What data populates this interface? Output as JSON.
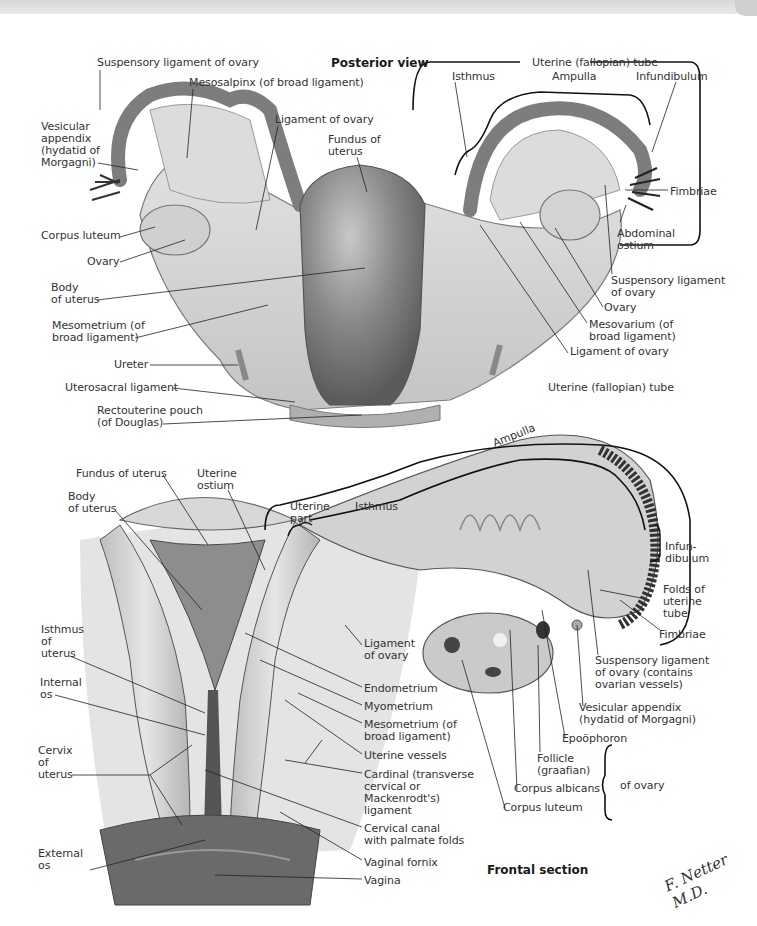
{
  "figure": {
    "colors": {
      "background": "#ffffff",
      "tissue_light": "#d9d9d9",
      "tissue_mid": "#a8a8a8",
      "tissue_dark": "#6e6e6e",
      "line": "#222222"
    },
    "posterior": {
      "title": "Posterior view",
      "labels": [
        {
          "id": "susp-lig-ovary-l",
          "text": "Suspensory ligament of ovary",
          "x": 97,
          "y": 57
        },
        {
          "id": "mesosalpinx",
          "text": "Mesosalpinx (of broad ligament)",
          "x": 189,
          "y": 77
        },
        {
          "id": "ligament-of-ovary-l",
          "text": "Ligament of ovary",
          "x": 275,
          "y": 114
        },
        {
          "id": "fundus-of-uterus",
          "text": "Fundus of\nuterus",
          "x": 328,
          "y": 134
        },
        {
          "id": "vesicular-appendix-l",
          "text": "Vesicular\nappendix\n(hydatid of\nMorgagni)",
          "x": 41,
          "y": 121
        },
        {
          "id": "corpus-luteum-l",
          "text": "Corpus luteum",
          "x": 41,
          "y": 230
        },
        {
          "id": "ovary-l",
          "text": "Ovary",
          "x": 87,
          "y": 256
        },
        {
          "id": "body-of-uterus",
          "text": "Body\nof uterus",
          "x": 51,
          "y": 282
        },
        {
          "id": "mesometrium",
          "text": "Mesometrium (of\nbroad ligament)",
          "x": 52,
          "y": 320
        },
        {
          "id": "ureter",
          "text": "Ureter",
          "x": 114,
          "y": 359
        },
        {
          "id": "uterosacral-ligament",
          "text": "Uterosacral ligament",
          "x": 65,
          "y": 382
        },
        {
          "id": "rectouterine-pouch",
          "text": "Rectouterine pouch\n(of Douglas)",
          "x": 97,
          "y": 405
        },
        {
          "id": "uterine-tube-top",
          "text": "Uterine (fallopian) tube",
          "x": 532,
          "y": 57
        },
        {
          "id": "isthmus-top",
          "text": "Isthmus",
          "x": 452,
          "y": 71
        },
        {
          "id": "ampulla-top",
          "text": "Ampulla",
          "x": 552,
          "y": 71
        },
        {
          "id": "infundibulum-top",
          "text": "Infundibulum",
          "x": 636,
          "y": 71
        },
        {
          "id": "fimbriae-top",
          "text": "Fimbriae",
          "x": 670,
          "y": 186
        },
        {
          "id": "abdominal-ostium",
          "text": "Abdominal\nostium",
          "x": 617,
          "y": 228
        },
        {
          "id": "susp-lig-ovary-r",
          "text": "Suspensory ligament\nof ovary",
          "x": 611,
          "y": 275
        },
        {
          "id": "ovary-r",
          "text": "Ovary",
          "x": 604,
          "y": 302
        },
        {
          "id": "mesovarium",
          "text": "Mesovarium (of\nbroad ligament)",
          "x": 589,
          "y": 319
        },
        {
          "id": "ligament-of-ovary-r",
          "text": "Ligament of ovary",
          "x": 570,
          "y": 346
        },
        {
          "id": "uterine-tube-mid",
          "text": "Uterine (fallopian) tube",
          "x": 548,
          "y": 382
        }
      ]
    },
    "frontal": {
      "title": "Frontal section",
      "labels": [
        {
          "id": "fundus-of-uterus-f",
          "text": "Fundus of uterus",
          "x": 76,
          "y": 468
        },
        {
          "id": "uterine-ostium",
          "text": "Uterine\nostium",
          "x": 197,
          "y": 468
        },
        {
          "id": "body-of-uterus-f",
          "text": "Body\nof uterus",
          "x": 68,
          "y": 491
        },
        {
          "id": "uterine-part",
          "text": "Uterine\npart",
          "x": 290,
          "y": 501
        },
        {
          "id": "isthmus-f",
          "text": "Isthmus",
          "x": 355,
          "y": 501
        },
        {
          "id": "ampulla-f",
          "text": "Ampulla",
          "x": 492,
          "y": 430
        },
        {
          "id": "infundibulum-f",
          "text": "Infun-\ndibulum",
          "x": 665,
          "y": 541
        },
        {
          "id": "folds-uterine-tube",
          "text": "Folds of\nuterine\ntube",
          "x": 663,
          "y": 584
        },
        {
          "id": "fimbriae-f",
          "text": "Fimbriae",
          "x": 659,
          "y": 629
        },
        {
          "id": "isthmus-of-uterus",
          "text": "Isthmus\nof\nuterus",
          "x": 41,
          "y": 624
        },
        {
          "id": "internal-os",
          "text": "Internal\nos",
          "x": 40,
          "y": 677
        },
        {
          "id": "cervix-of-uterus",
          "text": "Cervix\nof\nuterus",
          "x": 38,
          "y": 745
        },
        {
          "id": "external-os",
          "text": "External\nos",
          "x": 38,
          "y": 848
        },
        {
          "id": "ligament-of-ovary-f",
          "text": "Ligament\nof ovary",
          "x": 364,
          "y": 638
        },
        {
          "id": "endometrium",
          "text": "Endometrium",
          "x": 364,
          "y": 683
        },
        {
          "id": "myometrium",
          "text": "Myometrium",
          "x": 364,
          "y": 701
        },
        {
          "id": "mesometrium-f",
          "text": "Mesometrium (of\nbroad ligament)",
          "x": 364,
          "y": 719
        },
        {
          "id": "uterine-vessels",
          "text": "Uterine vessels",
          "x": 364,
          "y": 750
        },
        {
          "id": "cardinal-ligament",
          "text": "Cardinal (transverse\ncervical or\nMackenrodt's)\nligament",
          "x": 364,
          "y": 769
        },
        {
          "id": "cervical-canal",
          "text": "Cervical canal\nwith palmate folds",
          "x": 364,
          "y": 823
        },
        {
          "id": "vaginal-fornix",
          "text": "Vaginal fornix",
          "x": 364,
          "y": 857
        },
        {
          "id": "vagina",
          "text": "Vagina",
          "x": 364,
          "y": 875
        },
        {
          "id": "susp-lig-ovary-f",
          "text": "Suspensory ligament\nof ovary (contains\novarian vessels)",
          "x": 595,
          "y": 655
        },
        {
          "id": "vesicular-appendix-f",
          "text": "Vesicular appendix\n(hydatid of Morgagni)",
          "x": 579,
          "y": 702
        },
        {
          "id": "epoophoron",
          "text": "Epoöphoron",
          "x": 562,
          "y": 733
        },
        {
          "id": "follicle",
          "text": "Follicle\n(graafian)",
          "x": 537,
          "y": 753
        },
        {
          "id": "corpus-albicans",
          "text": "Corpus albicans",
          "x": 514,
          "y": 783
        },
        {
          "id": "corpus-luteum-f",
          "text": "Corpus luteum",
          "x": 503,
          "y": 802
        },
        {
          "id": "of-ovary",
          "text": "of ovary",
          "x": 620,
          "y": 780
        }
      ]
    },
    "signature": "F. Netter M.D."
  }
}
